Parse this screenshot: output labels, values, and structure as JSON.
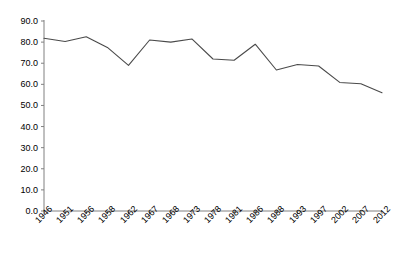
{
  "chart_data": {
    "type": "line",
    "title": "",
    "subtitle": "",
    "xlabel": "",
    "ylabel": "",
    "categories": [
      "1946",
      "1951",
      "1956",
      "1958",
      "1962",
      "1967",
      "1968",
      "1973",
      "1978",
      "1981",
      "1986",
      "1988",
      "1993",
      "1997",
      "2002",
      "2007",
      "2012"
    ],
    "values": [
      81.8,
      80.3,
      82.5,
      77.5,
      69.0,
      81.0,
      80.0,
      81.5,
      72.0,
      71.4,
      79.0,
      66.8,
      69.4,
      68.7,
      60.9,
      60.3,
      56.0
    ],
    "series": [
      {
        "name": "",
        "values": [
          81.8,
          80.3,
          82.5,
          77.5,
          69.0,
          81.0,
          80.0,
          81.5,
          72.0,
          71.4,
          79.0,
          66.8,
          69.4,
          68.7,
          60.9,
          60.3,
          56.0
        ]
      }
    ],
    "ylim": [
      0.0,
      90.0
    ],
    "ytick_labels": [
      "0.0",
      "10.0",
      "20.0",
      "30.0",
      "40.0",
      "50.0",
      "60.0",
      "70.0",
      "80.0",
      "90.0"
    ],
    "ytick_values": [
      0.0,
      10.0,
      20.0,
      30.0,
      40.0,
      50.0,
      60.0,
      70.0,
      80.0,
      90.0
    ],
    "grid": false,
    "legend": false,
    "legend_position": "none",
    "line_color": "#4a4a4a",
    "axis_color": "#808080",
    "background_color": "#ffffff",
    "annotations": []
  }
}
